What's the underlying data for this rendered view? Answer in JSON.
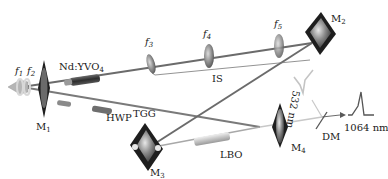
{
  "diagram": {
    "type": "optical-setup",
    "components": {
      "f1": "f",
      "f1_sub": "1",
      "f2": "f",
      "f2_sub": "2",
      "f3": "f",
      "f3_sub": "3",
      "f4": "f",
      "f4_sub": "4",
      "f5": "f",
      "f5_sub": "5",
      "crystal": "Nd:YVO",
      "crystal_sub": "4",
      "m1": "M",
      "m1_sub": "1",
      "m2": "M",
      "m2_sub": "2",
      "m3": "M",
      "m3_sub": "3",
      "m4": "M",
      "m4_sub": "4",
      "hwp": "HWP",
      "tgg": "TGG",
      "lbo": "LBO",
      "is": "IS",
      "dm": "DM"
    },
    "outputs": {
      "green": "532 nm",
      "ir": "1064 nm"
    },
    "colors": {
      "beam": "#6b6b6b",
      "beam_light": "#c8c8c8",
      "mirror_frame": "#1e1e1e",
      "mirror_face": "#8a8a8a",
      "lens": "#7a7a7a",
      "crystal_body": "#3c3c3c",
      "lbo_body": "#cfcfcf",
      "pump_cone": "#b0b0b0"
    }
  }
}
